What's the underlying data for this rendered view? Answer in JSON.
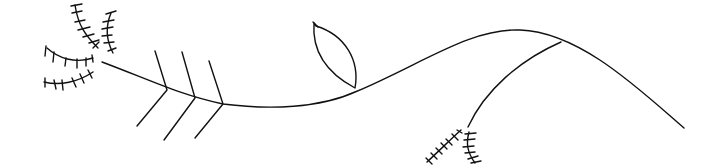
{
  "canvas": {
    "width": 719,
    "height": 167,
    "background": "#ffffff",
    "stroke_color": "#111111"
  },
  "drawing": {
    "description": "Line drawing of a branch-like curve with an arrow-fletching shape, a leaf outline, and feather-like barbed strokes",
    "elements": [
      "main-curve",
      "fletching",
      "leaf",
      "barbed-strokes",
      "side-branch"
    ]
  }
}
